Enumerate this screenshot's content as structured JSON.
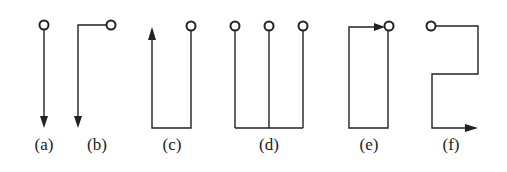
{
  "diagram": {
    "colors": {
      "stroke": "#222222",
      "background": "#ffffff"
    },
    "panels": [
      {
        "id": "a",
        "label": "(a)",
        "description": "terminal with straight line down, arrow pointing down"
      },
      {
        "id": "b",
        "label": "(b)",
        "description": "terminal, line left then down, arrow pointing down"
      },
      {
        "id": "c",
        "label": "(c)",
        "description": "terminal, line down, across left, up; arrow pointing up"
      },
      {
        "id": "d",
        "label": "(d)",
        "description": "three terminals joined by a common bottom bus"
      },
      {
        "id": "e",
        "label": "(e)",
        "description": "closed loop: terminal down, left, up, right arrow back to terminal"
      },
      {
        "id": "f",
        "label": "(f)",
        "description": "terminal right, down, left, down, right arrow"
      }
    ]
  }
}
